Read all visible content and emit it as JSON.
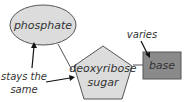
{
  "diagram": {
    "nodes": {
      "phosphate": {
        "label": "phosphate",
        "shape": "ellipse",
        "fill": "#dcdcdc"
      },
      "sugar": {
        "line1": "deoxyribose",
        "line2": "sugar",
        "shape": "pentagon",
        "fill": "#dcdcdc"
      },
      "base": {
        "label": "base",
        "shape": "rectangle",
        "fill": "#8a8a8a"
      }
    },
    "annotations": {
      "stays_line1": "stays the",
      "stays_line2": "same",
      "varies": "varies"
    },
    "colors": {
      "stroke": "#555555",
      "text": "#333333"
    }
  }
}
